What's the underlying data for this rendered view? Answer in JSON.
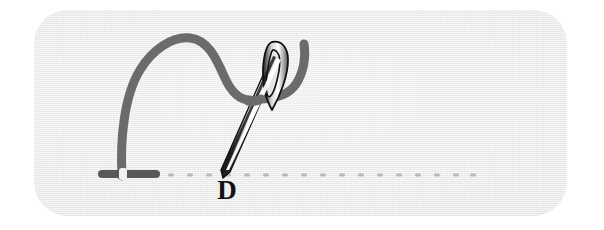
{
  "diagram": {
    "step_label": "D",
    "canvas": {
      "width": 604,
      "height": 230,
      "background_color": "#ffffff"
    },
    "card": {
      "name": "fabric-swatch",
      "x": 34,
      "y": 10,
      "width": 533,
      "height": 206,
      "corner_radius": 34,
      "fill_color": "#e9e9e9",
      "texture": "woven-horizontal-weave"
    },
    "baseline": {
      "name": "fabric-guide-line",
      "y": 175,
      "x_start": 168,
      "x_end": 470,
      "dot_color": "#b9b9b9",
      "dot_count": 17,
      "dot_spacing": 19,
      "dot_width": 6,
      "dot_height": 3
    },
    "thread": {
      "name": "thread-path",
      "color": "#6b6b6b",
      "stroke_width": 9,
      "description": "Arched loop of thread rising from the left stitch, dipping at center, passing behind the needle and hooking down to the right."
    },
    "stitch_marks": [
      {
        "name": "left-stitch-mark",
        "color": "#585858",
        "center_x": 129,
        "center_y": 174,
        "width": 62,
        "height": 8
      }
    ],
    "needle": {
      "name": "sewing-needle",
      "outline_color": "#151515",
      "highlight_color": "#ffffff",
      "shaft_color": "#d6d6d6",
      "tip_x": 223,
      "tip_y": 177,
      "head_x": 283,
      "head_y": 44,
      "eye_label": "needle-eye",
      "eye_shape": "elongated-oval"
    }
  }
}
